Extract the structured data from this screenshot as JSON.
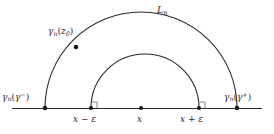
{
  "figure": {
    "width": 274,
    "height": 134,
    "background": "#ffffff",
    "stroke_color": "#2b2b2b",
    "text_color": "#2b2b2b"
  },
  "labels": {
    "outer_arc": {
      "base": "L",
      "sub": "n",
      "full": "L_n"
    },
    "arc_point": {
      "base": "γ",
      "sub": "n",
      "arg": "z",
      "arg_sub": "0",
      "full": "γ_n(z_0)"
    },
    "left_endpoint": {
      "base": "γ",
      "sub": "n",
      "arg": "γ",
      "sup": "−",
      "full": "γ_n(γ⁻)"
    },
    "right_endpoint": {
      "base": "γ",
      "sub": "n",
      "arg": "γ",
      "sup": "+",
      "full": "γ_n(γ⁺)"
    },
    "axis_left_tick": {
      "full": "x − ε",
      "var": "x",
      "op": "−",
      "eps": "ε"
    },
    "axis_center_tick": {
      "full": "x",
      "var": "x"
    },
    "axis_right_tick": {
      "full": "x + ε",
      "var": "x",
      "op": "+",
      "eps": "ε"
    }
  },
  "geometry": {
    "baseline": {
      "y": 108,
      "x_start": 12,
      "x_end": 262
    },
    "outer_arc": {
      "cx": 141,
      "cy": 108,
      "r": 96,
      "left_x": 45,
      "right_x": 237
    },
    "inner_arc": {
      "cx": 145,
      "cy": 108,
      "r": 54,
      "left_x": 91,
      "right_x": 199
    },
    "points": [
      {
        "name": "left-endpoint-dot",
        "x": 45,
        "y": 108
      },
      {
        "name": "arc-point-dot",
        "x": 76,
        "y": 47
      },
      {
        "name": "inner-left-foot-dot",
        "x": 91,
        "y": 108
      },
      {
        "name": "center-dot",
        "x": 141,
        "y": 108
      },
      {
        "name": "inner-right-foot-dot",
        "x": 199,
        "y": 108
      },
      {
        "name": "right-endpoint-dot",
        "x": 237,
        "y": 108
      }
    ],
    "right_angle_marks": [
      {
        "name": "inner-left-right-angle",
        "x": 91,
        "y": 108
      },
      {
        "name": "inner-right-right-angle",
        "x": 199,
        "y": 108
      }
    ]
  }
}
